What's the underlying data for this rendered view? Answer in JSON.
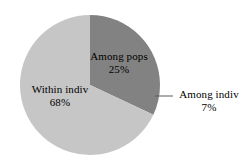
{
  "chart_data": {
    "type": "pie",
    "title": "",
    "subtitle": "",
    "xlabel": "",
    "ylabel": "",
    "legend_position": "none",
    "grid": false,
    "labels_inside": true,
    "categories": [
      "Among pops",
      "Among indiv",
      "Within indiv"
    ],
    "values": [
      25,
      7,
      68
    ],
    "value_unit": "%",
    "start_angle_deg": 0,
    "direction": "clockwise",
    "slices": [
      {
        "name": "Among pops",
        "value": 25,
        "value_label": "25%",
        "color": "#828282",
        "label_placement": "inside"
      },
      {
        "name": "Among indiv",
        "value": 7,
        "value_label": "7%",
        "color": "#828282",
        "label_placement": "outside-leader"
      },
      {
        "name": "Within indiv",
        "value": 68,
        "value_label": "68%",
        "color": "#c6c6c6",
        "label_placement": "inside"
      }
    ]
  },
  "colors": {
    "background": "#ffffff",
    "slice_dark": "#828282",
    "slice_light": "#c6c6c6",
    "text": "#000000",
    "leader_line": "#5a5a5a"
  },
  "geometry": {
    "center_x": 90,
    "center_y": 85,
    "radius": 70
  }
}
